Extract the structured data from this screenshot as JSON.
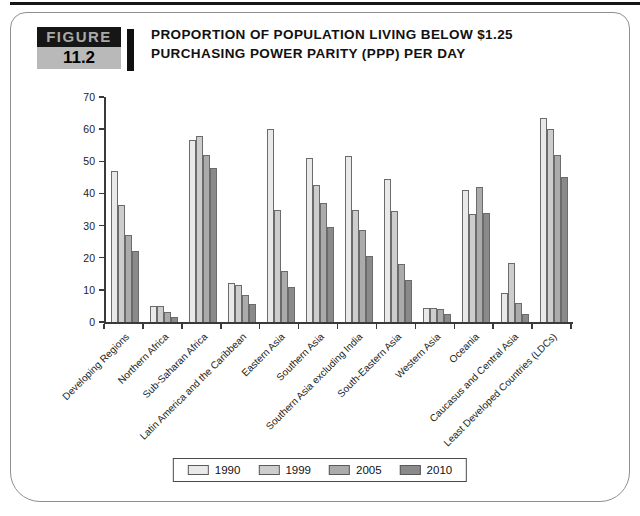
{
  "figure": {
    "label": "FIGURE",
    "number": "11.2",
    "title_line1": "PROPORTION OF POPULATION LIVING BELOW $1.25",
    "title_line2": "PURCHASING POWER PARITY (PPP) PER DAY"
  },
  "chart_data": {
    "type": "bar",
    "title": "Proportion of population living below $1.25 purchasing power parity (PPP) per day",
    "categories": [
      "Developing Regions",
      "Northern Africa",
      "Sub-Saharan Africa",
      "Latin America and the Caribbean",
      "Eastern Asia",
      "Southern Asia",
      "Southern Asia excluding India",
      "South-Eastern Asia",
      "Western Asia",
      "Oceania",
      "Caucasus and Central Asia",
      "Least Developed Countries (LDCs)"
    ],
    "series": [
      {
        "name": "1990",
        "color": "#e9e9e9",
        "values": [
          47,
          5,
          56.5,
          12,
          60,
          51,
          51.5,
          44.5,
          4.5,
          41,
          9,
          63.5
        ]
      },
      {
        "name": "1999",
        "color": "#cdcdcd",
        "values": [
          36.5,
          5,
          58,
          11.5,
          35,
          42.5,
          35,
          34.5,
          4.5,
          33.5,
          18.5,
          60
        ]
      },
      {
        "name": "2005",
        "color": "#ababab",
        "values": [
          27,
          3,
          52,
          8.5,
          16,
          37,
          28.5,
          18,
          4,
          42,
          6,
          52
        ]
      },
      {
        "name": "2010",
        "color": "#8a8a8a",
        "values": [
          22,
          1.5,
          48,
          5.5,
          11,
          29.5,
          20.5,
          13,
          2.5,
          34,
          2.5,
          45
        ]
      }
    ],
    "xlabel": "",
    "ylabel": "",
    "ylim": [
      0,
      70
    ],
    "yticks": [
      0,
      10,
      20,
      30,
      40,
      50,
      60,
      70
    ],
    "grid": false,
    "legend_position": "bottom",
    "bar_border_color": "#6b6b6b",
    "axis_color": "#3a3a3a"
  }
}
